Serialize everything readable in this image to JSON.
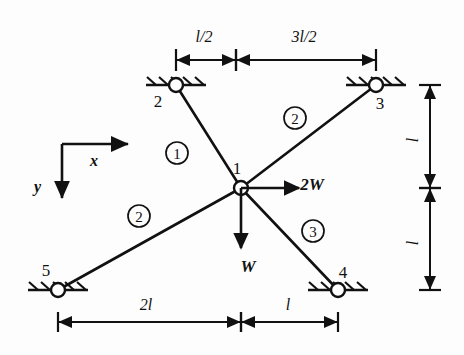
{
  "figure": {
    "type": "structural-truss-diagram",
    "line_color": "#111111",
    "background_color": "#fdfdfd"
  },
  "axes": {
    "x_label": "x",
    "y_label": "y",
    "x_direction": "right",
    "y_direction": "down"
  },
  "nodes": [
    {
      "id": "1",
      "label": "1",
      "x": 241,
      "y": 188,
      "support": "none",
      "label_dx": -4,
      "label_dy": -14
    },
    {
      "id": "2",
      "label": "2",
      "x": 176,
      "y": 85,
      "support": "pinned",
      "label_dx": -18,
      "label_dy": 22
    },
    {
      "id": "3",
      "label": "3",
      "x": 376,
      "y": 85,
      "support": "pinned",
      "label_dx": 4,
      "label_dy": 24
    },
    {
      "id": "4",
      "label": "4",
      "x": 338,
      "y": 290,
      "support": "pinned",
      "label_dx": 5,
      "label_dy": -12
    },
    {
      "id": "5",
      "label": "5",
      "x": 58,
      "y": 290,
      "support": "pinned",
      "label_dx": -12,
      "label_dy": -14
    }
  ],
  "members": [
    {
      "id": "m1",
      "label": "1",
      "from": "2",
      "to": "1",
      "label_x": 177,
      "label_y": 153
    },
    {
      "id": "m2",
      "label": "2",
      "from": "1",
      "to": "3",
      "label_x": 295,
      "label_y": 118
    },
    {
      "id": "m3",
      "label": "2",
      "from": "5",
      "to": "1",
      "label_x": 139,
      "label_y": 216
    },
    {
      "id": "m4",
      "label": "3",
      "from": "1",
      "to": "4",
      "label_x": 313,
      "label_y": 231
    }
  ],
  "loads": [
    {
      "id": "load-horizontal",
      "label": "2W",
      "at_node": "1",
      "direction": "right",
      "length": 58,
      "label_x": 312,
      "label_y": 190
    },
    {
      "id": "load-vertical",
      "label": "W",
      "at_node": "1",
      "direction": "down",
      "length": 60,
      "label_x": 248,
      "label_y": 272
    }
  ],
  "dimensions": {
    "top": [
      {
        "id": "dim-l-over-2",
        "label": "l/2",
        "from_x": 176,
        "to_x": 236,
        "y": 60,
        "label_x": 204,
        "label_y": 42
      },
      {
        "id": "dim-3l-over-2",
        "label": "3l/2",
        "from_x": 236,
        "to_x": 376,
        "y": 60,
        "label_x": 304,
        "label_y": 42
      }
    ],
    "bottom": [
      {
        "id": "dim-2l",
        "label": "2l",
        "from_x": 58,
        "to_x": 241,
        "y": 322,
        "label_x": 146,
        "label_y": 310
      },
      {
        "id": "dim-l",
        "label": "l",
        "from_x": 241,
        "to_x": 338,
        "y": 322,
        "label_x": 288,
        "label_y": 310
      }
    ],
    "right": [
      {
        "id": "dim-l-upper",
        "label": "l",
        "from_y": 85,
        "to_y": 188,
        "x": 430,
        "label_x": 418,
        "label_y": 140
      },
      {
        "id": "dim-l-lower",
        "label": "l",
        "from_y": 188,
        "to_y": 290,
        "x": 430,
        "label_x": 418,
        "label_y": 243
      }
    ]
  }
}
